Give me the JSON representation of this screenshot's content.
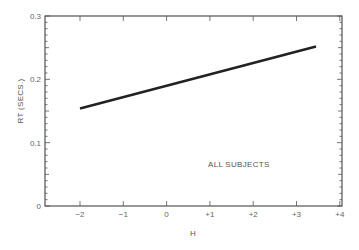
{
  "chart_data": {
    "type": "line",
    "title": "",
    "xlabel": "H",
    "ylabel": "RT (SECS.)",
    "xlim": [
      -2.0,
      4.0
    ],
    "ylim": [
      0,
      0.3
    ],
    "x_ticks": [
      "−2",
      "−1",
      "0",
      "+1",
      "+2",
      "+3",
      "+4"
    ],
    "x_tick_values": [
      -2,
      -1,
      0,
      1,
      2,
      3,
      4
    ],
    "y_ticks": [
      "0",
      "0.1",
      "0.2",
      "0.3"
    ],
    "y_tick_values": [
      0,
      0.1,
      0.2,
      0.3
    ],
    "grid": false,
    "annotations": [
      "ALL SUBJECTS"
    ],
    "series": [
      {
        "name": "ALL SUBJECTS",
        "x": [
          -2.0,
          3.45
        ],
        "y": [
          0.154,
          0.252
        ],
        "color": "#222222"
      }
    ]
  },
  "labels": {
    "annotation": "ALL SUBJECTS"
  }
}
